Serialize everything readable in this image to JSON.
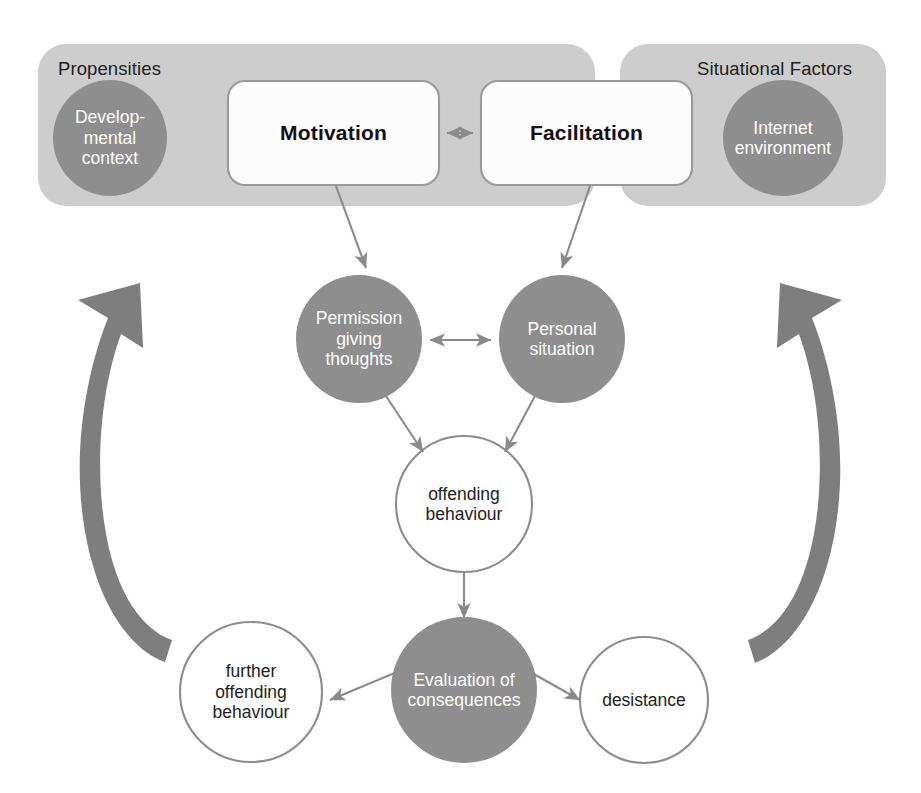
{
  "diagram": {
    "colors": {
      "panel_fill": "#cdcdcd",
      "dark_circle_fill": "#8e8e8e",
      "light_circle_stroke": "#8c8c8c",
      "box_fill": "#fcfcfc",
      "box_stroke": "#9a9a9a",
      "arrow_stroke": "#8a8a8a",
      "big_arrow_fill": "#7e7e7e",
      "dark_text": "#1d1d1d",
      "light_text": "#ffffff",
      "page_background": "#ffffff"
    },
    "panels": [
      {
        "id": "propensities",
        "label": "Propensities"
      },
      {
        "id": "situational_factors",
        "label": "Situational Factors"
      }
    ],
    "boxes": [
      {
        "id": "motivation",
        "label": "Motivation"
      },
      {
        "id": "facilitation",
        "label": "Facilitation"
      }
    ],
    "circles": [
      {
        "id": "developmental_context",
        "label": "Develop-\nmental\ncontext",
        "style": "dark"
      },
      {
        "id": "internet_environment",
        "label": "Internet\nenvironment",
        "style": "dark"
      },
      {
        "id": "permission_giving_thoughts",
        "label": "Permission\ngiving\nthoughts",
        "style": "dark"
      },
      {
        "id": "personal_situation",
        "label": "Personal\nsituation",
        "style": "dark"
      },
      {
        "id": "offending_behaviour",
        "label": "offending\nbehaviour",
        "style": "light"
      },
      {
        "id": "evaluation_of_consequences",
        "label": "Evaluation of\nconsequences",
        "style": "dark"
      },
      {
        "id": "further_offending_behaviour",
        "label": "further\noffending\nbehaviour",
        "style": "light"
      },
      {
        "id": "desistance",
        "label": "desistance",
        "style": "light"
      }
    ],
    "connectors": [
      {
        "id": "motivation-facilitation",
        "kind": "double-headed-arrow"
      },
      {
        "id": "motivation-to-permission-giving-thoughts",
        "kind": "arrow"
      },
      {
        "id": "facilitation-to-personal-situation",
        "kind": "arrow"
      },
      {
        "id": "permission-giving-thoughts-personal-situation",
        "kind": "double-headed-arrow"
      },
      {
        "id": "permission-giving-thoughts-to-offending-behaviour",
        "kind": "arrow"
      },
      {
        "id": "personal-situation-to-offending-behaviour",
        "kind": "arrow"
      },
      {
        "id": "offending-behaviour-to-evaluation",
        "kind": "arrow"
      },
      {
        "id": "evaluation-to-further-offending-behaviour",
        "kind": "arrow"
      },
      {
        "id": "evaluation-to-desistance",
        "kind": "arrow"
      },
      {
        "id": "left-feedback-loop",
        "kind": "curved-arrow-up"
      },
      {
        "id": "right-feedback-loop",
        "kind": "curved-arrow-up"
      }
    ]
  }
}
